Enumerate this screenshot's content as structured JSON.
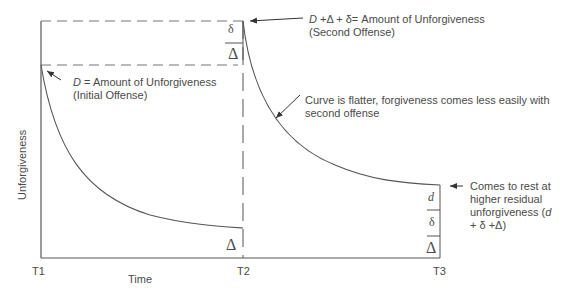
{
  "diagram": {
    "y_axis_label": "Unforgiveness",
    "x_axis_label": "Time",
    "ticks": {
      "t1": "T1",
      "t2": "T2",
      "t3": "T3"
    },
    "symbols": {
      "delta_small": "δ",
      "delta_large": "Δ",
      "d_small": "d"
    },
    "annotations": {
      "initial": {
        "var": "D",
        "text": " = Amount of Unforgiveness",
        "line2": "(Initial Offense)"
      },
      "second": {
        "var": "D",
        "text": " +Δ + δ= Amount of Unforgiveness",
        "line2": "(Second Offense)"
      },
      "flatter": {
        "line1": "Curve is flatter, forgiveness comes less easily with",
        "line2": "second offense"
      },
      "rest": {
        "line1": "Comes to rest at",
        "line2": "higher residual",
        "line3_prefix": "unforgiveness (",
        "line3_var": "d",
        "line4": "+ δ +Δ)"
      }
    },
    "colors": {
      "line": "#555555",
      "text": "#4a4a4a",
      "background": "#ffffff"
    }
  }
}
